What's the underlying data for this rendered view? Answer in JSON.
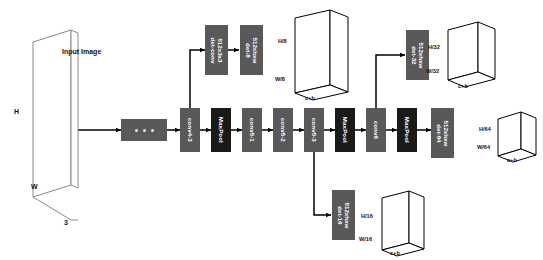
{
  "diagram": {
    "colors": {
      "conv_block": "#595959",
      "pool_block": "#1a1a1a",
      "line": "#000000",
      "background": "#ffffff"
    },
    "input": {
      "caption": "Input Image",
      "height_label": "H",
      "width_label": "W",
      "depth_label": "3"
    },
    "ellipsis_block": {
      "label": "...",
      "dots": 3
    },
    "backbone": [
      {
        "name": "conv4-3",
        "type": "conv"
      },
      {
        "name": "MaxPool",
        "type": "pool"
      },
      {
        "name": "conv5-1",
        "type": "conv"
      },
      {
        "name": "conv5-2",
        "type": "conv"
      },
      {
        "name": "conv5-3",
        "type": "conv"
      },
      {
        "name": "MaxPool",
        "type": "pool"
      },
      {
        "name": "conv6",
        "type": "conv"
      },
      {
        "name": "MaxPool",
        "type": "pool"
      }
    ],
    "det_conv": {
      "line1": "det-conv",
      "line2": "512x3x3"
    },
    "heads": [
      {
        "id": "det-8",
        "line1": "det-8",
        "line2": "512xhxw"
      },
      {
        "id": "det-16",
        "line1": "det-16",
        "line2": "512xhxw"
      },
      {
        "id": "det-32",
        "line1": "det-32",
        "line2": "512xhxw"
      },
      {
        "id": "det-64",
        "line1": "det-64",
        "line2": "512xhxw"
      }
    ],
    "output_cubes": [
      {
        "id": "cube-8",
        "height": "H/8",
        "width": "W/8",
        "depth": "c+b"
      },
      {
        "id": "cube-16",
        "height": "H/16",
        "width": "W/16",
        "depth": "c+b"
      },
      {
        "id": "cube-32",
        "height": "H/32",
        "width": "W/32",
        "depth": "c+b"
      },
      {
        "id": "cube-64",
        "height": "H/64",
        "width": "W/64",
        "depth": "c+b"
      }
    ]
  }
}
